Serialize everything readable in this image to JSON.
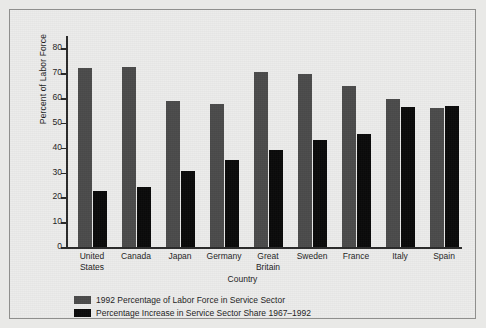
{
  "chart_data": {
    "type": "bar",
    "title": "",
    "xlabel": "Country",
    "ylabel": "Percent of Labor Force",
    "ylim": [
      0,
      85
    ],
    "yticks": [
      0,
      10,
      20,
      30,
      40,
      50,
      60,
      70,
      80
    ],
    "grid": false,
    "legend_position": "below-axis-left",
    "categories": [
      "United States",
      "Canada",
      "Japan",
      "Germany",
      "Great Britain",
      "Sweden",
      "France",
      "Italy",
      "Spain"
    ],
    "category_labels": [
      "United\nStates",
      "Canada",
      "Japan",
      "Germany",
      "Great\nBritain",
      "Sweden",
      "France",
      "Italy",
      "Spain"
    ],
    "series": [
      {
        "name": "1992 Percentage of Labor Force in Service Sector",
        "color": "#4b4b4b",
        "values": [
          72,
          72.5,
          59,
          57.5,
          70.5,
          69.5,
          65,
          59.5,
          56
        ]
      },
      {
        "name": "Percentage Increase in Service Sector Share 1967–1992",
        "color": "#0a0a0a",
        "values": [
          22.5,
          24,
          30.5,
          35,
          39,
          43,
          45.5,
          56.5,
          57
        ]
      }
    ]
  },
  "legend": {
    "items": [
      {
        "label": "1992 Percentage of Labor Force in Service Sector",
        "color": "#4b4b4b"
      },
      {
        "label": "Percentage Increase in Service Sector Share 1967–1992",
        "color": "#0a0a0a"
      }
    ]
  },
  "colors": {
    "series_gray": "#4b4b4b",
    "series_black": "#0a0a0a",
    "plot_background": "#ececeb",
    "figure_background": "#e9e9e7",
    "axis": "#2a2a2a",
    "text": "#1d1d1d"
  }
}
